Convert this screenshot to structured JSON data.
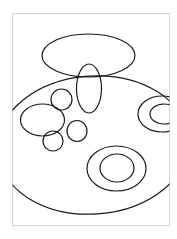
{
  "page": {
    "background": "#ffffff",
    "border_color": "#d4d4d4",
    "stroke_color": "#1a1a1a",
    "frame": {
      "x": 12.5,
      "y": 13.5,
      "width": 157,
      "height": 212
    }
  },
  "shapes": [
    {
      "id": "top-ellipse",
      "type": "ellipse",
      "cx": 88.5,
      "cy": 55.5,
      "rx": 46.5,
      "ry": 21.5,
      "rotate": 0
    },
    {
      "id": "tall-ellipse",
      "type": "ellipse",
      "cx": 89,
      "cy": 88.5,
      "rx": 12.5,
      "ry": 24.5,
      "rotate": 0
    },
    {
      "id": "large-ellipse",
      "type": "ellipse",
      "cx": 93,
      "cy": 145,
      "rx": 96,
      "ry": 69,
      "rotate": -4
    },
    {
      "id": "small-circle-upper",
      "type": "ellipse",
      "cx": 61.5,
      "cy": 99.5,
      "rx": 10.5,
      "ry": 10.5,
      "rotate": 0
    },
    {
      "id": "left-ellipse",
      "type": "ellipse",
      "cx": 42.5,
      "cy": 120,
      "rx": 22,
      "ry": 16,
      "rotate": 0
    },
    {
      "id": "small-circle-lower-left",
      "type": "ellipse",
      "cx": 53,
      "cy": 141,
      "rx": 10,
      "ry": 10,
      "rotate": 0
    },
    {
      "id": "small-circle-lower-right",
      "type": "ellipse",
      "cx": 77,
      "cy": 131,
      "rx": 10,
      "ry": 10.5,
      "rotate": 0
    },
    {
      "id": "right-ring-outer",
      "type": "ellipse",
      "cx": 162,
      "cy": 114,
      "rx": 24,
      "ry": 18,
      "rotate": 0
    },
    {
      "id": "right-ring-inner",
      "type": "ellipse",
      "cx": 164,
      "cy": 114,
      "rx": 14,
      "ry": 10,
      "rotate": 0
    },
    {
      "id": "concentric-outer",
      "type": "ellipse",
      "cx": 116.5,
      "cy": 168.5,
      "rx": 29.5,
      "ry": 22.5,
      "rotate": 0
    },
    {
      "id": "concentric-inner",
      "type": "ellipse",
      "cx": 117,
      "cy": 168,
      "rx": 17,
      "ry": 14,
      "rotate": 0
    }
  ]
}
